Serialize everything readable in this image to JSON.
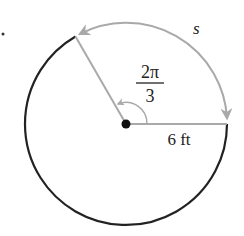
{
  "diagram": {
    "type": "circle-arc-length",
    "bullet": "•",
    "labels": {
      "arc": "s",
      "angle_numerator": "2π",
      "angle_denominator": "3",
      "radius": "6 ft"
    },
    "values": {
      "radius_ft": 6,
      "angle_radians": "2π/3"
    },
    "colors": {
      "circle": "#222222",
      "highlight": "#a9a9a9",
      "center_dot": "#111111",
      "text": "#222222"
    }
  }
}
